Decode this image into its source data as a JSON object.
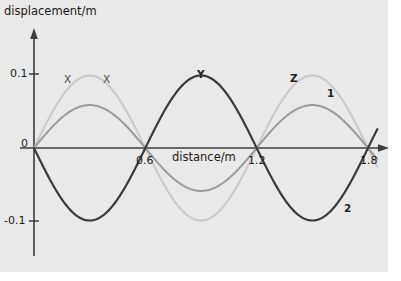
{
  "chart_data": {
    "type": "line",
    "title": "",
    "xlabel": "distance/m",
    "ylabel": "displacement/m",
    "xlim": [
      0,
      1.85
    ],
    "ylim": [
      -0.125,
      0.125
    ],
    "grid": false,
    "legend": "inline-labels",
    "x_ticks": [
      "0.6",
      "1.2",
      "1.8"
    ],
    "x_tick_values": [
      0.6,
      1.2,
      1.8
    ],
    "y_ticks": [
      "0.1",
      "0",
      "-0.1"
    ],
    "y_tick_values": [
      0.1,
      0,
      -0.1
    ],
    "origin_label": "0",
    "wavelength": 1.2,
    "series": [
      {
        "name": "X",
        "label": "X",
        "color": "#c9c9c9",
        "amplitude": 0.098,
        "phase_deg": 0,
        "linewidth": 2.0
      },
      {
        "name": "1",
        "label": "1",
        "color": "#9a9a9a",
        "amplitude": 0.058,
        "phase_deg": 0,
        "linewidth": 2.0
      },
      {
        "name": "2",
        "label": "2",
        "color": "#3a3a3a",
        "amplitude": 0.098,
        "phase_deg": 180,
        "linewidth": 2.2
      }
    ],
    "annotations": [
      {
        "text": "X",
        "x": 0.21,
        "y": 0.108
      },
      {
        "text": "X",
        "x": 0.42,
        "y": 0.108
      },
      {
        "text": "Y",
        "x": 0.9,
        "y": 0.112
      },
      {
        "text": "Z",
        "x": 1.4,
        "y": 0.108
      },
      {
        "text": "1",
        "x": 1.6,
        "y": 0.088
      },
      {
        "text": "2",
        "x": 1.68,
        "y": -0.082
      }
    ]
  },
  "axes": {
    "y_axis_title": "displacement/m",
    "x_axis_title": "distance/m",
    "y_label_top": "0.1",
    "y_label_zero": "0",
    "y_label_bottom": "-0.1",
    "x_label_1": "0.6",
    "x_label_2": "1.2",
    "x_label_3": "1.8"
  },
  "curve_labels": {
    "x_left": "X",
    "x_right": "X",
    "y": "Y",
    "z": "Z",
    "one": "1",
    "two": "2"
  },
  "colors": {
    "background": "#e9e9e9",
    "page": "#ffffff",
    "axis": "#3c3c3c",
    "text": "#1a1a1a",
    "curve_light": "#c9c9c9",
    "curve_medium": "#9a9a9a",
    "curve_dark": "#3a3a3a"
  }
}
